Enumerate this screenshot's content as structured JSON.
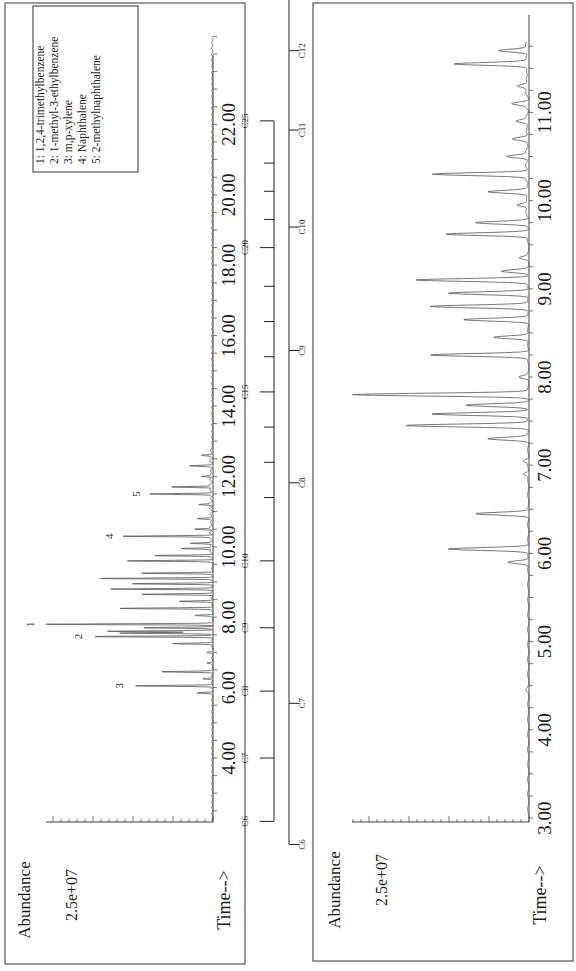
{
  "chart_data": [
    {
      "type": "line",
      "title": "Total ion chromatogram (full run)",
      "xlabel": "Time-->",
      "ylabel": "Abundance",
      "y_tick_label": "2.5e+07",
      "x_ticks": [
        "4.00",
        "6.00",
        "8.00",
        "10.00",
        "12.00",
        "14.00",
        "16.00",
        "18.00",
        "20.00",
        "22.00"
      ],
      "xlim": [
        2.2,
        24.5
      ],
      "ylim": [
        0,
        1.0
      ],
      "grid": false,
      "peaks": [
        {
          "t": 5.85,
          "h": 0.09
        },
        {
          "t": 6.05,
          "h": 0.46,
          "label": "3"
        },
        {
          "t": 6.25,
          "h": 0.06
        },
        {
          "t": 6.45,
          "h": 0.3
        },
        {
          "t": 6.7,
          "h": 0.03
        },
        {
          "t": 7.0,
          "h": 0.03
        },
        {
          "t": 7.25,
          "h": 0.24
        },
        {
          "t": 7.45,
          "h": 0.7,
          "label": "2"
        },
        {
          "t": 7.55,
          "h": 0.55
        },
        {
          "t": 7.6,
          "h": 0.62
        },
        {
          "t": 7.7,
          "h": 0.4
        },
        {
          "t": 7.8,
          "h": 0.98,
          "label": "1"
        },
        {
          "t": 8.05,
          "h": 0.1
        },
        {
          "t": 8.25,
          "h": 0.55
        },
        {
          "t": 8.45,
          "h": 0.2
        },
        {
          "t": 8.65,
          "h": 0.42
        },
        {
          "t": 8.8,
          "h": 0.6
        },
        {
          "t": 8.95,
          "h": 0.48
        },
        {
          "t": 9.1,
          "h": 0.66
        },
        {
          "t": 9.25,
          "h": 0.42
        },
        {
          "t": 9.6,
          "h": 0.5
        },
        {
          "t": 9.75,
          "h": 0.34
        },
        {
          "t": 9.95,
          "h": 0.18
        },
        {
          "t": 10.1,
          "h": 0.12
        },
        {
          "t": 10.3,
          "h": 0.52,
          "label": "4"
        },
        {
          "t": 10.5,
          "h": 0.1
        },
        {
          "t": 10.8,
          "h": 0.08
        },
        {
          "t": 11.2,
          "h": 0.07
        },
        {
          "t": 11.5,
          "h": 0.36,
          "label": "5"
        },
        {
          "t": 11.7,
          "h": 0.24
        },
        {
          "t": 12.0,
          "h": 0.06
        },
        {
          "t": 12.3,
          "h": 0.12
        },
        {
          "t": 12.6,
          "h": 0.05
        }
      ],
      "annotations": [
        "1",
        "2",
        "3",
        "4",
        "5"
      ],
      "legend": {
        "position": "upper-right",
        "entries": [
          "1:  1,2,4-trimethylbenzene",
          "2:  1-methyl-3-ethylbenzene",
          "3:  m,p-xylene",
          "4:  Naphthalene",
          "5:  2-methylnaphthalene"
        ]
      },
      "carbon_scale": {
        "labels": [
          "C6",
          "C7",
          "C8",
          "C9",
          "C10",
          "C15",
          "C20",
          "C25"
        ],
        "label_times": [
          2.2,
          4.0,
          5.9,
          7.7,
          9.6,
          14.4,
          18.5,
          22.1
        ]
      }
    },
    {
      "type": "line",
      "title": "Total ion chromatogram (expanded 3-11.5 min)",
      "xlabel": "Time-->",
      "ylabel": "Abundance",
      "y_tick_label": "2.5e+07",
      "x_ticks": [
        "3.00",
        "4.00",
        "5.00",
        "6.00",
        "7.00",
        "8.00",
        "9.00",
        "10.00",
        "11.00"
      ],
      "xlim": [
        3.0,
        11.8
      ],
      "ylim": [
        0,
        1.0
      ],
      "grid": false,
      "peaks": [
        {
          "t": 4.45,
          "h": 0.01
        },
        {
          "t": 5.9,
          "h": 0.12
        },
        {
          "t": 6.05,
          "h": 0.46
        },
        {
          "t": 6.45,
          "h": 0.3
        },
        {
          "t": 6.9,
          "h": 0.03
        },
        {
          "t": 7.05,
          "h": 0.03
        },
        {
          "t": 7.3,
          "h": 0.23
        },
        {
          "t": 7.45,
          "h": 0.7
        },
        {
          "t": 7.58,
          "h": 0.55
        },
        {
          "t": 7.68,
          "h": 0.35
        },
        {
          "t": 7.8,
          "h": 1.0
        },
        {
          "t": 8.0,
          "h": 0.05
        },
        {
          "t": 8.25,
          "h": 0.56
        },
        {
          "t": 8.45,
          "h": 0.2
        },
        {
          "t": 8.65,
          "h": 0.37
        },
        {
          "t": 8.8,
          "h": 0.56
        },
        {
          "t": 8.95,
          "h": 0.46
        },
        {
          "t": 9.1,
          "h": 0.64
        },
        {
          "t": 9.2,
          "h": 0.15
        },
        {
          "t": 9.35,
          "h": 0.05
        },
        {
          "t": 9.62,
          "h": 0.47
        },
        {
          "t": 9.75,
          "h": 0.3
        },
        {
          "t": 9.95,
          "h": 0.06
        },
        {
          "t": 10.1,
          "h": 0.22
        },
        {
          "t": 10.3,
          "h": 0.54
        },
        {
          "t": 10.5,
          "h": 0.12
        },
        {
          "t": 10.7,
          "h": 0.08
        },
        {
          "t": 10.9,
          "h": 0.06
        },
        {
          "t": 11.1,
          "h": 0.08
        },
        {
          "t": 11.3,
          "h": 0.06
        },
        {
          "t": 11.55,
          "h": 0.42
        },
        {
          "t": 11.7,
          "h": 0.17
        }
      ],
      "carbon_scale": {
        "labels": [
          "C6",
          "C7",
          "C8",
          "C9",
          "C10",
          "C11",
          "C12",
          "C13"
        ],
        "label_times": [
          2.7,
          4.3,
          6.8,
          8.3,
          9.7,
          10.8,
          11.7,
          12.6
        ]
      }
    }
  ],
  "panels": {
    "left": {
      "abundance_label": "Abundance",
      "y_tick_label": "2.5e+07",
      "time_label": "Time-->",
      "time_ticks": [
        "4.00",
        "6.00",
        "8.00",
        "10.00",
        "12.00",
        "14.00",
        "16.00",
        "18.00",
        "20.00",
        "22.00"
      ],
      "peak_labels": [
        "1",
        "2",
        "3",
        "4",
        "5"
      ],
      "legend": [
        "1:  1,2,4-trimethylbenzene",
        "2:  1-methyl-3-ethylbenzene",
        "3:  m,p-xylene",
        "4:  Naphthalene",
        "5:  2-methylnaphthalene"
      ],
      "carbon_labels": [
        "C6",
        "C7",
        "C8",
        "C9",
        "C10",
        "C15",
        "C20",
        "C25"
      ]
    },
    "right": {
      "abundance_label": "Abundance",
      "y_tick_label": "2.5e+07",
      "time_label": "Time-->",
      "time_ticks": [
        "3.00",
        "4.00",
        "5.00",
        "6.00",
        "7.00",
        "8.00",
        "9.00",
        "10.00",
        "11.00"
      ],
      "carbon_labels": [
        "C6",
        "C7",
        "C8",
        "C9",
        "C10",
        "C11",
        "C12",
        "C13"
      ]
    }
  }
}
